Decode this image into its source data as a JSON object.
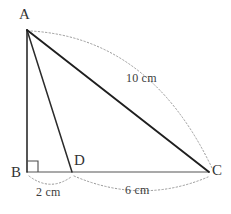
{
  "figure": {
    "vertices": [
      {
        "name": "A",
        "label": "A",
        "x": 27,
        "y": 30,
        "label_x": 19,
        "label_y": 7
      },
      {
        "name": "B",
        "label": "B",
        "x": 27,
        "y": 172,
        "label_x": 11,
        "label_y": 165
      },
      {
        "name": "D",
        "label": "D",
        "x": 72,
        "y": 172,
        "label_x": 74,
        "label_y": 153
      },
      {
        "name": "C",
        "label": "C",
        "x": 209,
        "y": 172,
        "label_x": 212,
        "label_y": 163
      }
    ],
    "segments": [
      {
        "name": "segment-ab",
        "from": "A",
        "to": "B",
        "x1": 27,
        "y1": 30,
        "x2": 27,
        "y2": 172,
        "stroke": "#2b2b2b",
        "width": 1.6
      },
      {
        "name": "segment-ac",
        "from": "A",
        "to": "C",
        "x1": 27,
        "y1": 30,
        "x2": 209,
        "y2": 172,
        "stroke": "#1f1f1f",
        "width": 1.9
      },
      {
        "name": "segment-ad",
        "from": "A",
        "to": "D",
        "x1": 27,
        "y1": 30,
        "x2": 72,
        "y2": 172,
        "stroke": "#2b2b2b",
        "width": 1.5
      },
      {
        "name": "segment-bc",
        "from": "B",
        "to": "C",
        "x1": 27,
        "y1": 172,
        "x2": 209,
        "y2": 172,
        "stroke": "#555555",
        "width": 1.2
      }
    ],
    "right_angle": {
      "name": "right-angle-marker-b",
      "at_vertex": "B",
      "path": "M 27 161 L 38 161 L 38 172",
      "stroke": "#4a4a4a",
      "width": 1.1
    },
    "measure_arcs": [
      {
        "name": "measure-arc-ac",
        "from": "A",
        "to": "C",
        "path": "M 31 31 Q 150 38 212 168",
        "stroke": "#9a9a9a",
        "dash": "1.4 2.2"
      },
      {
        "name": "measure-arc-bd",
        "from": "B",
        "to": "D",
        "path": "M 29 176 Q 50 192 71 177",
        "stroke": "#9a9a9a",
        "dash": "1.4 2.2"
      },
      {
        "name": "measure-arc-dc",
        "from": "D",
        "to": "C",
        "path": "M 74 176 Q 142 205 208 177",
        "stroke": "#9a9a9a",
        "dash": "1.4 2.2"
      }
    ],
    "measure_labels": [
      {
        "name": "measure-label-ac",
        "text": "10 cm",
        "value": 10,
        "unit": "cm",
        "for_segment": "AC",
        "x": 126,
        "y": 72
      },
      {
        "name": "measure-label-bd",
        "text": "2 cm",
        "value": 2,
        "unit": "cm",
        "for_segment": "BD",
        "x": 36,
        "y": 186
      },
      {
        "name": "measure-label-dc",
        "text": "6 cm",
        "value": 6,
        "unit": "cm",
        "for_segment": "DC",
        "x": 125,
        "y": 184
      }
    ],
    "colors": {
      "background": "#ffffff",
      "primary_line": "#1f1f1f",
      "secondary_line": "#555555",
      "arc_line": "#9a9a9a",
      "text": "#333333"
    }
  }
}
